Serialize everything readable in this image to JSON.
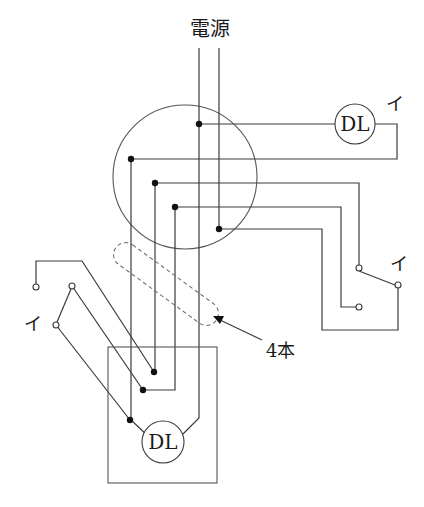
{
  "diagram": {
    "type": "electrical-wiring-diagram",
    "power_source_label": "電源",
    "wire_count_note": "4本",
    "junction_box": {
      "shape": "circle",
      "center": [
        185,
        177
      ],
      "radius": 72
    },
    "lamps": [
      {
        "id": "lamp-upper-right",
        "label": "DL",
        "switch_symbol": "イ"
      },
      {
        "id": "lamp-lower-box",
        "label": "DL"
      }
    ],
    "switches": [
      {
        "id": "switch-right",
        "label": "イ",
        "type": "3-way"
      },
      {
        "id": "switch-left",
        "label": "イ",
        "type": "3-way"
      }
    ],
    "colors": {
      "wire": "#3a3a3a",
      "node": "#111111",
      "background": "#ffffff"
    }
  }
}
